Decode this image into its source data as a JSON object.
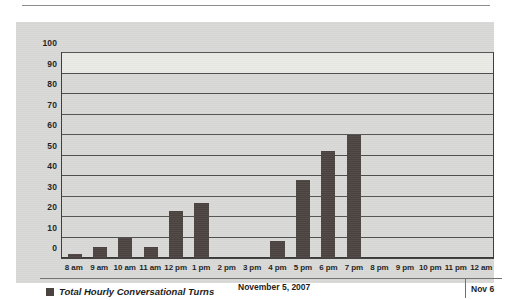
{
  "chart_data": {
    "type": "bar",
    "title": "",
    "xlabel": "",
    "ylabel": "",
    "ylim": [
      0,
      100
    ],
    "yticks": [
      0,
      10,
      20,
      30,
      40,
      50,
      60,
      70,
      80,
      90,
      100
    ],
    "grid": true,
    "legend_position": "bottom-left",
    "categories": [
      "8 am",
      "9 am",
      "10 am",
      "11 am",
      "12 pm",
      "1 pm",
      "2 pm",
      "3 pm",
      "4 pm",
      "5 pm",
      "6 pm",
      "7 pm",
      "8 pm",
      "9 pm",
      "10 pm",
      "11 pm",
      "12 am"
    ],
    "series": [
      {
        "name": "Total Hourly Conversational Turns",
        "values": [
          2,
          5.5,
          10,
          5.5,
          23,
          27,
          0,
          0,
          8.5,
          38,
          52,
          60,
          0,
          0,
          0,
          0,
          0
        ]
      }
    ],
    "annotations": {
      "date": "November 5, 2007",
      "next_day": "Nov 6"
    }
  },
  "legend": {
    "series_label": "Total Hourly Conversational Turns",
    "swatch_color": "#4a4340"
  },
  "footer": {
    "date": "November 5, 2007",
    "next_day": "Nov 6"
  },
  "colors": {
    "bar": "#4a4340",
    "panel": "#d8d8d6",
    "axis": "#3a3a3a",
    "gridline": "#4f4f4f",
    "text": "#1d1d1d"
  }
}
